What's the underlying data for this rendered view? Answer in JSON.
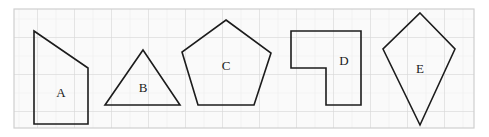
{
  "figure": {
    "background_color": "#ffffff",
    "grid": {
      "cell_size": 18.5,
      "minor_color": "#f2f2f2",
      "major_color": "#d8d8d8",
      "fill_color": "#fafafa",
      "frame_color": "#cfcfcf",
      "frame": {
        "x": 14,
        "y": 9,
        "width": 460,
        "height": 119
      }
    },
    "stroke_color": "#1c1c1c",
    "stroke_width": 1.6,
    "shapes": [
      {
        "id": "A",
        "label": "A",
        "kind": "right-trapezoid",
        "points": "34,31 88,68 88,124 34,124",
        "label_x": 61,
        "label_y": 94
      },
      {
        "id": "B",
        "label": "B",
        "kind": "triangle",
        "points": "143,50 180,105 105,105",
        "label_x": 143,
        "label_y": 89
      },
      {
        "id": "C",
        "label": "C",
        "kind": "pentagon",
        "points": "226,20 271,53 254,105 198,105 182,52",
        "label_x": 226,
        "label_y": 67
      },
      {
        "id": "D",
        "label": "D",
        "kind": "L-hexagon",
        "points": "291,31 361,31 361,105 326,105 326,68 291,68",
        "label_x": 344,
        "label_y": 62
      },
      {
        "id": "E",
        "label": "E",
        "kind": "kite",
        "points": "420,13 455,49 420,125 383,49",
        "label_x": 420,
        "label_y": 70
      }
    ]
  }
}
